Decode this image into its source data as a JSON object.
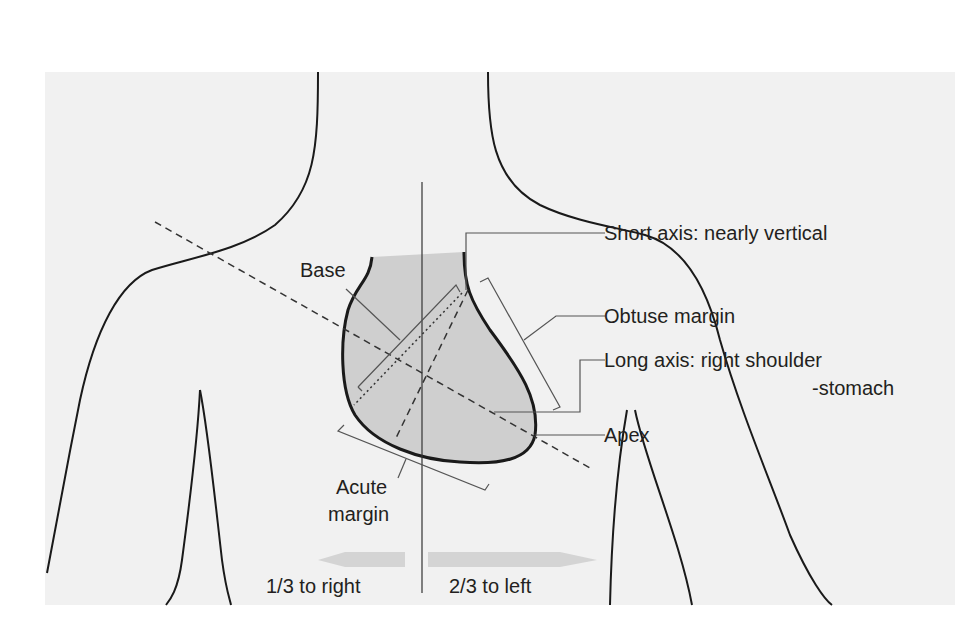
{
  "diagram": {
    "colors": {
      "background": "#ffffff",
      "panel": "#f1f1f1",
      "heart_fill": "#cfcfcf",
      "outline": "#1a1a1a",
      "leader_line": "#555555",
      "arrow_fill": "#d4d4d4",
      "text": "#231f20"
    },
    "labels": {
      "short_axis": "Short axis: nearly vertical",
      "obtuse_margin": "Obtuse margin",
      "long_axis_line1": "Long axis: right shoulder",
      "long_axis_line2": "-stomach",
      "apex": "Apex",
      "base": "Base",
      "acute_margin_line1": "Acute",
      "acute_margin_line2": "margin",
      "right_fraction": "1/3 to right",
      "left_fraction": "2/3 to left"
    },
    "arrows": {
      "right": {
        "direction": "left",
        "fraction": "1/3"
      },
      "left": {
        "direction": "right",
        "fraction": "2/3"
      }
    }
  }
}
